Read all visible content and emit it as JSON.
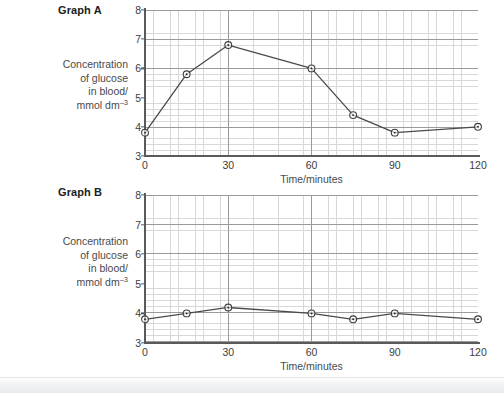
{
  "page": {
    "background_color": "#ffffff",
    "bottom_band_color": "#e9eaec"
  },
  "graphs": [
    {
      "id": "graph-a",
      "title": "Graph A",
      "y_axis_label_lines": [
        "Concentration",
        "of glucose",
        "in blood/",
        "mmol dm"
      ],
      "y_axis_label_superscript": "–3",
      "x_axis_title": "Time/minutes",
      "y_ticks": [
        "3",
        "4",
        "5",
        "6",
        "7",
        "8"
      ],
      "x_ticks": [
        "0",
        "30",
        "60",
        "90",
        "120"
      ]
    },
    {
      "id": "graph-b",
      "title": "Graph B",
      "y_axis_label_lines": [
        "Concentration",
        "of glucose",
        "in blood/",
        "mmol dm"
      ],
      "y_axis_label_superscript": "–3",
      "x_axis_title": "Time/minutes",
      "y_ticks": [
        "3",
        "4",
        "5",
        "6",
        "7",
        "8"
      ],
      "x_ticks": [
        "0",
        "30",
        "60",
        "90",
        "120"
      ]
    }
  ],
  "chart_data": [
    {
      "type": "line",
      "title": "Graph A",
      "xlabel": "Time/minutes",
      "ylabel": "Concentration of glucose in blood/ mmol dm–3",
      "xlim": [
        0,
        120
      ],
      "ylim": [
        3,
        8
      ],
      "xticks": [
        0,
        30,
        60,
        90,
        120
      ],
      "yticks": [
        3,
        4,
        5,
        6,
        7,
        8
      ],
      "grid": true,
      "minor_grid": true,
      "legend": "none",
      "marker": "circle-with-center-dot",
      "line_color": "#4a4a4a",
      "x": [
        0,
        15,
        30,
        60,
        75,
        90,
        120
      ],
      "y": [
        3.8,
        5.8,
        6.8,
        6.0,
        4.4,
        3.8,
        4.0
      ]
    },
    {
      "type": "line",
      "title": "Graph B",
      "xlabel": "Time/minutes",
      "ylabel": "Concentration of glucose in blood/ mmol dm–3",
      "xlim": [
        0,
        120
      ],
      "ylim": [
        3,
        8
      ],
      "xticks": [
        0,
        30,
        60,
        90,
        120
      ],
      "yticks": [
        3,
        4,
        5,
        6,
        7,
        8
      ],
      "grid": true,
      "minor_grid": true,
      "legend": "none",
      "marker": "circle-with-center-dot",
      "line_color": "#4a4a4a",
      "x": [
        0,
        15,
        30,
        60,
        75,
        90,
        120
      ],
      "y": [
        3.8,
        4.0,
        4.2,
        4.0,
        3.8,
        4.0,
        3.8
      ]
    }
  ]
}
